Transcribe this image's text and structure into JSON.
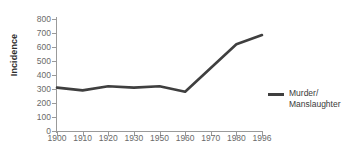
{
  "chart_data": {
    "type": "line",
    "title": "",
    "xlabel": "",
    "ylabel": "Incidence",
    "categories": [
      "1900",
      "1910",
      "1920",
      "1930",
      "1950",
      "1960",
      "1970",
      "1980",
      "1996"
    ],
    "x_tick_labels": [
      "1900",
      "1910",
      "1920",
      "1930",
      "1950",
      "1960",
      "1970",
      "1980",
      "1996"
    ],
    "y_tick_labels": [
      "800",
      "700",
      "600",
      "500",
      "400",
      "300",
      "200",
      "100",
      "0"
    ],
    "y_tick_values": [
      800,
      700,
      600,
      500,
      400,
      300,
      200,
      100,
      0
    ],
    "ylim": [
      0,
      800
    ],
    "grid": false,
    "legend_position": "right",
    "series": [
      {
        "name": "Murder/\nManslaughter",
        "color": "#3f3f3f",
        "values": [
          310,
          290,
          320,
          310,
          320,
          280,
          450,
          620,
          685
        ]
      }
    ]
  },
  "legend": {
    "entries": [
      {
        "label": "Murder/\nManslaughter",
        "color": "#3f3f3f"
      }
    ]
  },
  "colors": {
    "series": "#3f3f3f",
    "axis": "#9a9a9a",
    "tick_text": "#6a6a6a",
    "axis_label": "#2b2b2b",
    "background": "#ffffff"
  }
}
